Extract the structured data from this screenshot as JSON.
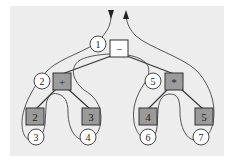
{
  "diagram": {
    "type": "expression-tree-euler-tour",
    "colors": {
      "background": "#ededed",
      "panel": "#ebebeb",
      "root_fill": "#ffffff",
      "internal_fill": "#9c9c9c",
      "leaf_fill": "#9a9a9a",
      "stroke": "#333333",
      "circle_fill": "#ffffff"
    },
    "nodes": {
      "root": {
        "label": "−"
      },
      "plus": {
        "label": "+"
      },
      "times": {
        "label": "*"
      },
      "leaf_a": {
        "label": "2"
      },
      "leaf_b": {
        "label": "3"
      },
      "leaf_c": {
        "label": "4"
      },
      "leaf_d": {
        "label": "5"
      }
    },
    "visit_markers": [
      {
        "label": "1"
      },
      {
        "label": "2"
      },
      {
        "label": "3"
      },
      {
        "label": "4"
      },
      {
        "label": "5"
      },
      {
        "label": "6"
      },
      {
        "label": "7"
      }
    ]
  }
}
